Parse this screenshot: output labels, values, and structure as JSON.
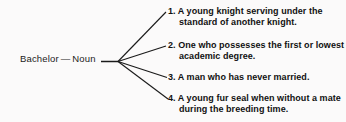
{
  "diagram": {
    "type": "word-sense-tree",
    "root": {
      "headword": "Bachelor",
      "separator": "—",
      "part_of_speech": "Noun"
    },
    "senses": [
      {
        "number": "1.",
        "text": "A young knight serving under the standard of another knight."
      },
      {
        "number": "2.",
        "text": "One who possesses the first or lowest academic degree."
      },
      {
        "number": "3.",
        "text": "A man who has never married."
      },
      {
        "number": "4.",
        "text": "A young fur seal when without a mate during the breeding time."
      }
    ],
    "colors": {
      "background": "#fbfafa",
      "text": "#111111",
      "line": "#1a1a1a"
    }
  }
}
